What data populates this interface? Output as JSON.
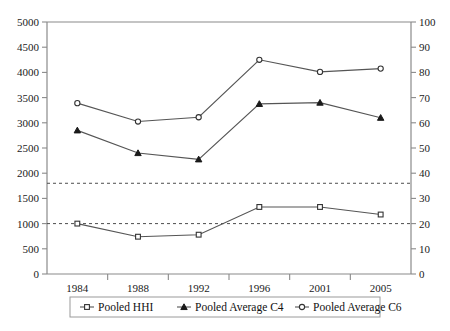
{
  "chart_data": {
    "type": "line",
    "title": "",
    "xlabel": "",
    "ylabel": "",
    "categories": [
      "1984",
      "1988",
      "1992",
      "1996",
      "2001",
      "2005"
    ],
    "series": [
      {
        "name": "Pooled HHI",
        "axis": "left",
        "marker": "open-square",
        "values": [
          1000,
          740,
          780,
          1330,
          1330,
          1180
        ]
      },
      {
        "name": "Pooled Average C4",
        "axis": "right",
        "marker": "filled-triangle",
        "values": [
          57,
          48,
          45.5,
          67.5,
          68,
          62
        ]
      },
      {
        "name": "Pooled Average C6",
        "axis": "right",
        "marker": "open-circle",
        "values": [
          67.8,
          60.5,
          62.2,
          85,
          80.2,
          81.5
        ]
      }
    ],
    "left_axis": {
      "min": 0,
      "max": 5000,
      "step": 500,
      "ticks": [
        "0",
        "500",
        "1000",
        "1500",
        "2000",
        "2500",
        "3000",
        "3500",
        "4000",
        "4500",
        "5000"
      ]
    },
    "right_axis": {
      "min": 0,
      "max": 100,
      "step": 10,
      "ticks": [
        "0",
        "10",
        "20",
        "30",
        "40",
        "50",
        "60",
        "70",
        "80",
        "90",
        "100"
      ]
    },
    "reference_lines": [
      {
        "name": "hhi-1800-threshold",
        "left_value": 1800,
        "right_value": 36,
        "style": "dashed"
      },
      {
        "name": "hhi-1000-threshold",
        "left_value": 1000,
        "right_value": 20,
        "style": "dashed"
      }
    ],
    "grid": false,
    "legend_position": "bottom"
  },
  "legend": {
    "items": [
      {
        "label": "Pooled HHI",
        "marker": "open-square"
      },
      {
        "label": "Pooled Average C4",
        "marker": "filled-triangle"
      },
      {
        "label": "Pooled Average C6",
        "marker": "open-circle"
      }
    ]
  },
  "colors": {
    "axis": "#8a8a8a",
    "line": "#555555",
    "text": "#111111",
    "reference": "#4d4d4d",
    "background": "#ffffff"
  }
}
